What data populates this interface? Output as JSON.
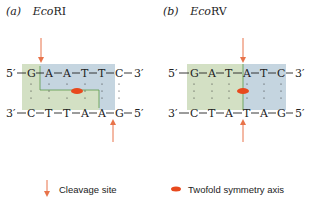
{
  "panels": [
    {
      "label": "(a)",
      "enzyme_prefix": "Eco",
      "enzyme_suffix": "RI",
      "top_strand": {
        "end5": "5′",
        "end3": "3′",
        "bases": [
          "G",
          "A",
          "A",
          "T",
          "T",
          "C"
        ]
      },
      "bottom_strand": {
        "end3": "3′",
        "end5": "5′",
        "bases": [
          "C",
          "T",
          "T",
          "A",
          "A",
          "G"
        ]
      },
      "cut_type": "staggered"
    },
    {
      "label": "(b)",
      "enzyme_prefix": "Eco",
      "enzyme_suffix": "RV",
      "top_strand": {
        "end5": "5′",
        "end3": "3′",
        "bases": [
          "G",
          "A",
          "T",
          "A",
          "T",
          "C"
        ]
      },
      "bottom_strand": {
        "end3": "3′",
        "end5": "5′",
        "bases": [
          "C",
          "T",
          "A",
          "T",
          "A",
          "G"
        ]
      },
      "cut_type": "blunt"
    }
  ],
  "legend": {
    "cleavage_label": "Cleavage site",
    "symmetry_label": "Twofold symmetry axis"
  },
  "colors": {
    "arrow": "#e8734a",
    "symmetry_axis": "#e8491d",
    "green_region": "#d3e0c4",
    "blue_region": "#c5d5e0",
    "divider": "#5a9a4a",
    "text": "#222222"
  }
}
